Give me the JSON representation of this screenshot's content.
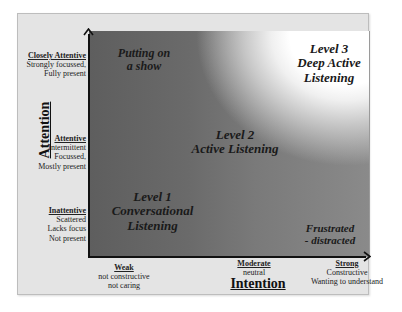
{
  "axes": {
    "x_title": "Intention",
    "y_title": "Attention"
  },
  "y_levels": [
    {
      "title": "Closely Attentive",
      "lines": [
        "Strongly focussed,",
        "Fully present"
      ]
    },
    {
      "title": "Attentive",
      "lines": [
        "Intermittent",
        "Focussed,",
        "Mostly present"
      ]
    },
    {
      "title": "Inattentive",
      "lines": [
        "Scattered",
        "Lacks focus",
        "Not present"
      ]
    }
  ],
  "x_levels": [
    {
      "title": "Weak",
      "lines": [
        "not constructive",
        "not caring"
      ]
    },
    {
      "title": "Moderate",
      "lines": [
        "neutral"
      ]
    },
    {
      "title": "Strong",
      "lines": [
        "Constructive",
        "Wanting to understand"
      ]
    }
  ],
  "regions": {
    "show": [
      "Putting on",
      "a show"
    ],
    "level3": [
      "Level 3",
      "Deep Active",
      "Listening"
    ],
    "level2": [
      "Level 2",
      "Active Listening"
    ],
    "level1": [
      "Level 1",
      "Conversational",
      "Listening"
    ],
    "frustrated": [
      "Frustrated",
      "- distracted"
    ]
  },
  "colors": {
    "frame_bg": "#e4e4e4",
    "plot_dark": "#5e5e5e",
    "plot_light": "#ffffff",
    "axis": "#111111"
  }
}
